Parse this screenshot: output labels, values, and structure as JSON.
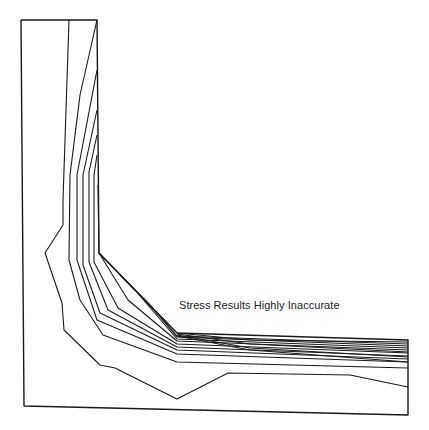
{
  "diagram": {
    "type": "stress-contour-plot",
    "shape": "L-shaped bracket",
    "annotation": "Stress Results Highly Inaccurate",
    "colors": {
      "background": "#ffffff",
      "line": "#1a1a1a",
      "text": "#222222"
    },
    "outline": [
      [
        21,
        20
      ],
      [
        97,
        20
      ],
      [
        99,
        253
      ],
      [
        177,
        333
      ],
      [
        408,
        340
      ],
      [
        408,
        415
      ],
      [
        24,
        406
      ],
      [
        21,
        20
      ]
    ],
    "contours": [
      [
        [
          69,
          20
        ],
        [
          63,
          200
        ],
        [
          63,
          225
        ],
        [
          45,
          253
        ],
        [
          62,
          303
        ],
        [
          64,
          330
        ],
        [
          100,
          365
        ],
        [
          115,
          368
        ],
        [
          177,
          399
        ],
        [
          228,
          373
        ],
        [
          350,
          375
        ],
        [
          408,
          387
        ]
      ],
      [
        [
          97,
          20
        ],
        [
          80,
          95
        ],
        [
          70,
          175
        ],
        [
          69,
          260
        ],
        [
          80,
          300
        ],
        [
          103,
          335
        ],
        [
          177,
          362
        ],
        [
          408,
          368
        ]
      ],
      [
        [
          97,
          70
        ],
        [
          77,
          175
        ],
        [
          77,
          260
        ],
        [
          97,
          320
        ],
        [
          177,
          354
        ],
        [
          408,
          362
        ]
      ],
      [
        [
          97,
          110
        ],
        [
          83,
          175
        ],
        [
          83,
          265
        ],
        [
          100,
          313
        ],
        [
          177,
          350
        ],
        [
          408,
          359
        ]
      ],
      [
        [
          97,
          135
        ],
        [
          89,
          172
        ],
        [
          89,
          262
        ],
        [
          108,
          310
        ],
        [
          177,
          347
        ],
        [
          408,
          356
        ]
      ],
      [
        [
          97,
          155
        ],
        [
          94,
          175
        ],
        [
          94,
          262
        ],
        [
          118,
          308
        ],
        [
          177,
          344
        ],
        [
          408,
          353
        ]
      ],
      [
        [
          98,
          185
        ],
        [
          99,
          253
        ],
        [
          128,
          300
        ],
        [
          177,
          341
        ],
        [
          408,
          350
        ]
      ],
      [
        [
          99,
          253
        ],
        [
          135,
          290
        ],
        [
          177,
          339
        ],
        [
          408,
          348
        ]
      ],
      [
        [
          120,
          275
        ],
        [
          150,
          305
        ],
        [
          177,
          337
        ],
        [
          408,
          346
        ]
      ],
      [
        [
          140,
          295
        ],
        [
          165,
          322
        ],
        [
          177,
          336
        ],
        [
          408,
          344
        ]
      ],
      [
        [
          177,
          333
        ],
        [
          250,
          340
        ],
        [
          408,
          342
        ]
      ],
      [
        [
          177,
          334
        ],
        [
          250,
          344
        ],
        [
          408,
          352
        ]
      ],
      [
        [
          177,
          335
        ],
        [
          250,
          348
        ],
        [
          408,
          357
        ]
      ],
      [
        [
          177,
          336
        ],
        [
          250,
          350
        ],
        [
          408,
          362
        ]
      ]
    ]
  }
}
